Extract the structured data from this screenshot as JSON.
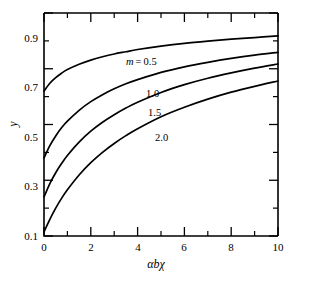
{
  "chart_data": {
    "type": "line",
    "title": "",
    "subtitle": "",
    "xlabel": "αbχ",
    "ylabel": "y",
    "xlim": [
      0,
      10
    ],
    "ylim": [
      0.1,
      0.9
    ],
    "grid": false,
    "legend_position": "inline-curve-labels",
    "x_major_ticks": [
      0,
      2,
      4,
      6,
      8,
      10
    ],
    "x_major_tick_labels": [
      "0",
      "2",
      "4",
      "6",
      "8",
      "10"
    ],
    "x_minor_ticks": [
      1,
      3,
      5,
      7,
      9
    ],
    "y_major_ticks": [
      0.1,
      0.3,
      0.5,
      0.7,
      0.9
    ],
    "y_major_tick_labels": [
      "0.1",
      "0.3",
      "0.5",
      "0.7",
      "0.9"
    ],
    "y_minor_ticks": [
      0.2,
      0.4,
      0.6,
      0.8
    ],
    "parameter_symbol": "m",
    "parameter_equals_text": "=",
    "series": [
      {
        "name": "0.5",
        "label": "m = 0.5",
        "label_text": "0.5",
        "color": "#000000",
        "x": [
          0,
          0.25,
          0.5,
          0.75,
          1,
          1.5,
          2,
          2.5,
          3,
          3.5,
          4,
          5,
          6,
          7,
          8,
          9,
          10
        ],
        "y": [
          0.62,
          0.648,
          0.668,
          0.684,
          0.697,
          0.716,
          0.731,
          0.743,
          0.753,
          0.761,
          0.769,
          0.781,
          0.791,
          0.799,
          0.806,
          0.812,
          0.818
        ]
      },
      {
        "name": "1.0",
        "label": "1.0",
        "label_text": "1.0",
        "color": "#000000",
        "x": [
          0,
          0.25,
          0.5,
          0.75,
          1,
          1.5,
          2,
          2.5,
          3,
          3.5,
          4,
          5,
          6,
          7,
          8,
          9,
          10
        ],
        "y": [
          0.38,
          0.424,
          0.459,
          0.488,
          0.512,
          0.551,
          0.582,
          0.607,
          0.628,
          0.646,
          0.661,
          0.687,
          0.707,
          0.723,
          0.737,
          0.749,
          0.759
        ]
      },
      {
        "name": "1.5",
        "label": "1.5",
        "label_text": "1.5",
        "color": "#000000",
        "x": [
          0,
          0.25,
          0.5,
          0.75,
          1,
          1.5,
          2,
          2.5,
          3,
          3.5,
          4,
          5,
          6,
          7,
          8,
          9,
          10
        ],
        "y": [
          0.24,
          0.288,
          0.327,
          0.36,
          0.389,
          0.437,
          0.476,
          0.508,
          0.535,
          0.559,
          0.58,
          0.615,
          0.643,
          0.666,
          0.685,
          0.702,
          0.717
        ]
      },
      {
        "name": "2.0",
        "label": "2.0",
        "label_text": "2.0",
        "color": "#000000",
        "x": [
          0,
          0.25,
          0.5,
          0.75,
          1,
          1.5,
          2,
          2.5,
          3,
          3.5,
          4,
          5,
          6,
          7,
          8,
          9,
          10
        ],
        "y": [
          0.115,
          0.16,
          0.2,
          0.235,
          0.266,
          0.319,
          0.363,
          0.4,
          0.432,
          0.46,
          0.485,
          0.528,
          0.562,
          0.591,
          0.616,
          0.637,
          0.656
        ]
      }
    ],
    "curve_label_positions": [
      {
        "x": 3.0,
        "y": 0.775
      },
      {
        "x": 3.9,
        "y": 0.69
      },
      {
        "x": 4.0,
        "y": 0.632
      },
      {
        "x": 4.3,
        "y": 0.548
      }
    ]
  },
  "axes": {
    "frame_color": "#000000",
    "background": "#ffffff"
  }
}
